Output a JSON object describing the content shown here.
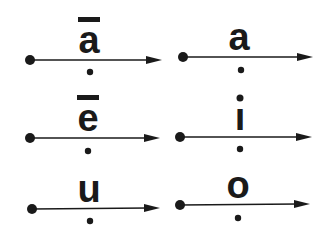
{
  "diagram": {
    "title": "",
    "color": "#1a1a1a",
    "items": [
      {
        "letter": "a",
        "macron": true,
        "dot_above": false,
        "start": [
          30,
          60
        ],
        "end": [
          162,
          60
        ],
        "cx": 89,
        "dot_below": [
          90,
          72
        ]
      },
      {
        "letter": "a",
        "macron": false,
        "dot_above": false,
        "start": [
          183,
          57
        ],
        "end": [
          313,
          57
        ],
        "cx": 239,
        "dot_below": [
          241,
          70
        ]
      },
      {
        "letter": "e",
        "macron": true,
        "dot_above": false,
        "start": [
          30,
          138
        ],
        "end": [
          160,
          138
        ],
        "cx": 88,
        "dot_below": [
          88,
          151
        ]
      },
      {
        "letter": "ı",
        "macron": false,
        "dot_above": true,
        "start": [
          180,
          137
        ],
        "end": [
          312,
          137
        ],
        "cx": 240,
        "dot_below": [
          240,
          149
        ]
      },
      {
        "letter": "u",
        "macron": false,
        "dot_above": false,
        "start": [
          32,
          209
        ],
        "end": [
          160,
          208
        ],
        "cx": 89,
        "dot_below": [
          90,
          221
        ]
      },
      {
        "letter": "o",
        "macron": false,
        "dot_above": false,
        "start": [
          180,
          205
        ],
        "end": [
          310,
          204
        ],
        "cx": 238,
        "dot_below": [
          238,
          218
        ]
      }
    ]
  }
}
